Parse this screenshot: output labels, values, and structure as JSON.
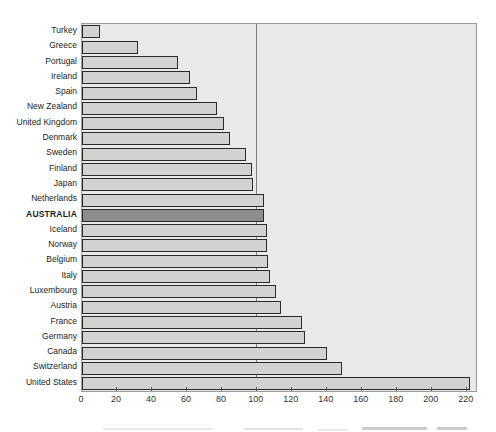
{
  "chart_data": {
    "type": "bar",
    "orientation": "horizontal",
    "title": "",
    "xlabel": "",
    "ylabel": "",
    "grid": "off",
    "legend": "none",
    "categories": [
      "Turkey",
      "Greece",
      "Portugal",
      "Ireland",
      "Spain",
      "New Zealand",
      "United Kingdom",
      "Denmark",
      "Sweden",
      "Finland",
      "Japan",
      "Netherlands",
      "AUSTRALIA",
      "Iceland",
      "Norway",
      "Belgium",
      "Italy",
      "Luxembourg",
      "Austria",
      "France",
      "Germany",
      "Canada",
      "Switzerland",
      "United States"
    ],
    "values": [
      10,
      31.5,
      54.5,
      61,
      65,
      76.5,
      80.5,
      84,
      93,
      96.5,
      97,
      103.5,
      103.5,
      105,
      105.5,
      106,
      107,
      110.5,
      113.5,
      125,
      127,
      139.5,
      148,
      221.5
    ],
    "highlight_category": "AUSTRALIA",
    "x_ticks": [
      0,
      20,
      40,
      60,
      80,
      100,
      120,
      140,
      160,
      180,
      200,
      220
    ],
    "xlim": [
      0,
      225.3
    ],
    "reference_line_x": 100
  },
  "colors": {
    "page_background": "#ffffff",
    "plot_background": "#e9e9e7",
    "plot_border": "#9b9b99",
    "bar_fill": "#d2d2d0",
    "bar_border": "#2b2b2b",
    "highlight_bar_fill": "#8d8d8b",
    "reference_line": "#7d7d7d",
    "tick": "#555555",
    "label_text": "#1c1c1c",
    "tick_label_text": "#333333"
  }
}
